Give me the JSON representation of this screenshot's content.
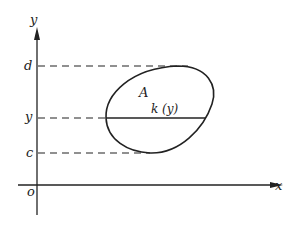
{
  "diagram": {
    "axes": {
      "x_label": "x",
      "y_label": "y",
      "origin_label": "o"
    },
    "y_ticks": [
      {
        "label": "d",
        "role": "upper bound"
      },
      {
        "label": "y",
        "role": "cross-section level"
      },
      {
        "label": "c",
        "role": "lower bound"
      }
    ],
    "region_label": "A",
    "cross_section_label": "k (y)",
    "colors": {
      "stroke": "#222222",
      "background": "#ffffff"
    }
  }
}
